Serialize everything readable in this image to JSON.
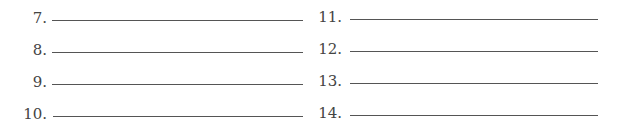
{
  "left_column": {
    "items": [
      {
        "number": "7."
      },
      {
        "number": "8."
      },
      {
        "number": "9."
      },
      {
        "number": "10."
      }
    ]
  },
  "right_column": {
    "items": [
      {
        "number": "11."
      },
      {
        "number": "12."
      },
      {
        "number": "13."
      },
      {
        "number": "14."
      }
    ]
  }
}
